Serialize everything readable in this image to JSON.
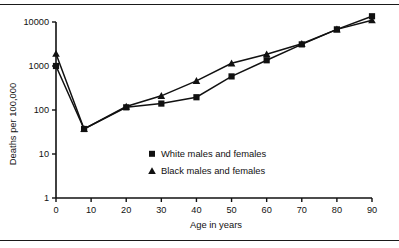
{
  "figure": {
    "frame": {
      "top_rule": true,
      "bottom_rule": true
    }
  },
  "chart_data": {
    "type": "line",
    "title": "",
    "xlabel": "Age in years",
    "ylabel": "Deaths per 100,000",
    "x": [
      0,
      8,
      20,
      30,
      40,
      50,
      60,
      70,
      80,
      90
    ],
    "xlim": [
      0,
      90
    ],
    "ylim": [
      1,
      10000
    ],
    "yscale": "log",
    "grid": false,
    "legend_position": "center",
    "x_ticks": [
      0,
      10,
      20,
      30,
      40,
      50,
      60,
      70,
      80,
      90
    ],
    "x_tick_labels": [
      "0",
      "10",
      "20",
      "30",
      "40",
      "50",
      "60",
      "70",
      "80",
      "90"
    ],
    "y_ticks": [
      1,
      10,
      100,
      1000,
      10000
    ],
    "y_tick_labels": [
      "1",
      "10",
      "100",
      "1000",
      "10000"
    ],
    "series": [
      {
        "name": "White males and females",
        "marker": "square",
        "color": "#111111",
        "values": [
          1000,
          37,
          115,
          140,
          195,
          580,
          1350,
          3100,
          6800,
          13500
        ]
      },
      {
        "name": "Black males and females",
        "marker": "triangle",
        "color": "#111111",
        "values": [
          1900,
          37,
          120,
          210,
          460,
          1150,
          1850,
          3200,
          6800,
          11000
        ]
      }
    ],
    "legend": [
      {
        "label": "White males and females",
        "marker": "square"
      },
      {
        "label": "Black males and females",
        "marker": "triangle"
      }
    ]
  }
}
